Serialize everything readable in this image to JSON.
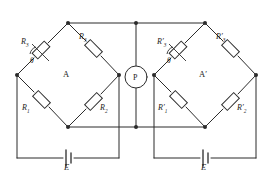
{
  "diagram": {
    "stroke_color": "#2b2b2b",
    "fill_color": "#ffffff",
    "bridges": [
      {
        "name": "A",
        "label": "A",
        "resistors": {
          "top_left": {
            "base": "R",
            "sub": "3",
            "prime": ""
          },
          "top_right": {
            "base": "R",
            "sub": "3",
            "prime": ""
          },
          "bottom_left": {
            "base": "R",
            "sub": "1",
            "prime": ""
          },
          "bottom_right": {
            "base": "R",
            "sub": "2",
            "prime": ""
          }
        },
        "angle_label": "θ",
        "source_label": "E"
      },
      {
        "name": "A-prime",
        "label": "A′",
        "resistors": {
          "top_left": {
            "base": "R",
            "sub": "3",
            "prime": "′"
          },
          "top_right": {
            "base": "R",
            "sub": "3",
            "prime": "′"
          },
          "bottom_left": {
            "base": "R",
            "sub": "1",
            "prime": "′"
          },
          "bottom_right": {
            "base": "R",
            "sub": "2",
            "prime": "′"
          }
        },
        "angle_label": "θ",
        "source_label": "E"
      }
    ],
    "meter": {
      "label": "P",
      "name": "galvanometer"
    },
    "labels": {
      "r3_left": "R",
      "r3_left_sub": "3",
      "r3_right": "R",
      "r3_right_sub": "3",
      "r1_left": "R",
      "r1_left_sub": "1",
      "r2_right": "R",
      "r2_right_sub": "2",
      "r3p_left": "R′",
      "r3p_left_sub": "3",
      "r3p_right": "R′",
      "r3p_right_sub": "3",
      "r1p_left": "R′",
      "r1p_left_sub": "1",
      "r2p_right": "R′",
      "r2p_right_sub": "2",
      "bridge_a": "A",
      "bridge_ap": "A′",
      "meter_p": "P",
      "theta_a": "θ",
      "theta_ap": "θ",
      "emf_left": "E",
      "emf_right": "E"
    }
  }
}
